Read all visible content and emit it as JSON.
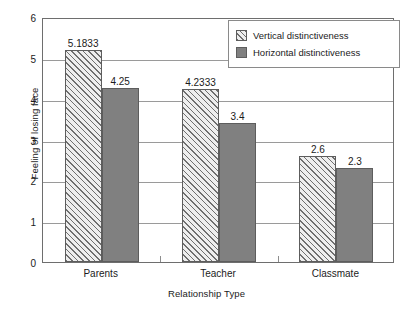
{
  "chart_data": {
    "type": "bar",
    "title": "",
    "xlabel": "Relationship Type",
    "ylabel": "Feeling of losing face",
    "categories": [
      "Parents",
      "Teacher",
      "Classmate"
    ],
    "series": [
      {
        "name": "Vertical distinctiveness",
        "values": [
          5.1833,
          4.2333,
          2.6
        ],
        "labels": [
          "5.1833",
          "4.2333",
          "2.6"
        ],
        "fill": "hatched",
        "color": "#eeeeee"
      },
      {
        "name": "Horizontal distinctiveness",
        "values": [
          4.25,
          3.4,
          2.3
        ],
        "labels": [
          "4.25",
          "3.4",
          "2.3"
        ],
        "fill": "solid",
        "color": "#808080"
      }
    ],
    "ylim": [
      0,
      6
    ],
    "yticks": [
      "6",
      "5",
      "4",
      "3",
      "2",
      "1",
      "0"
    ],
    "ytick_values": [
      6,
      5,
      4,
      3,
      2,
      1,
      0
    ],
    "grid": "horizontal",
    "legend_position": "top-right"
  },
  "legend": {
    "items": [
      {
        "label": "Vertical distinctiveness"
      },
      {
        "label": "Horizontal distinctiveness"
      }
    ]
  }
}
